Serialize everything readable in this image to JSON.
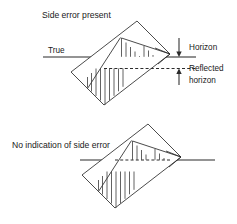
{
  "figure": {
    "kind": "technical-diagram",
    "background_color": "#ffffff",
    "line_color": "#2b2b2b",
    "panels": [
      {
        "id": "side-error-present",
        "title": "Side error present",
        "true_label": "True",
        "horizon_label": "Horizon",
        "reflected_label_line1": "Reflected",
        "reflected_label_line2": "horizon",
        "true_line_style": "solid",
        "reflected_line_style": "dashed",
        "offset_present": true
      },
      {
        "id": "no-side-error",
        "title": "No indication of side error",
        "true_line_style": "solid",
        "reflected_line_style": "dashed",
        "offset_present": false
      }
    ]
  },
  "icons": {
    "arrow_down": "arrow-down-icon",
    "arrow_up": "arrow-up-icon"
  }
}
